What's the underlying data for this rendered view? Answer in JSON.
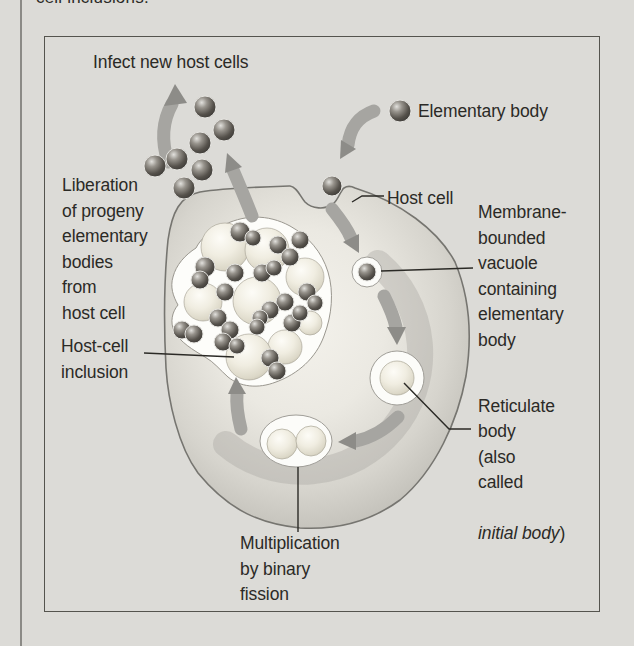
{
  "page": {
    "top_fragment": "cell inclusions.",
    "colors": {
      "background": "#dcdbd7",
      "text": "#2b2a26",
      "frame_border": "#55544e",
      "page_rule": "#8b8a86"
    }
  },
  "diagram": {
    "title_context": "Chlamydia developmental cycle",
    "labels": {
      "infect": "Infect new host cells",
      "elementary_body": "Elementary body",
      "liberation": "Liberation\nof progeny\nelementary\nbodies\nfrom\nhost cell",
      "host_cell": "Host cell",
      "membrane_vacuole": "Membrane-\nbounded\nvacuole\ncontaining\nelementary\nbody",
      "host_cell_inclusion": "Host-cell\ninclusion",
      "reticulate_prefix": "Reticulate\nbody\n(also\ncalled",
      "reticulate_italic": "initial body",
      "reticulate_suffix": ")",
      "multiplication": "Multiplication\nby binary\nfission"
    },
    "icons": {
      "elementary_body": "small dark sphere",
      "reticulate_body": "large pale sphere",
      "inclusion": "white blob filled with spheres"
    },
    "graphic_colors": {
      "dark_body": "#3c3a37",
      "light_body": "#ece8da",
      "arrow": "#a6a5a1",
      "arrow_head": "#8d8c88",
      "cell_membrane": "#767570",
      "vacuole_white": "#fcfcf9"
    }
  }
}
